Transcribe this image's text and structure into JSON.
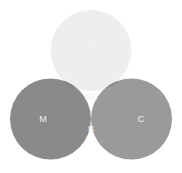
{
  "diagram": {
    "type": "venn",
    "background_color": "#ffffff",
    "canvas": {
      "width": 182,
      "height": 173
    },
    "circles": [
      {
        "id": "y",
        "label": "Y",
        "name": "Yellow",
        "cx": 91,
        "cy": 50.5,
        "r": 40.5,
        "fill": "#eeeeee",
        "label_x": 91,
        "label_y": 45,
        "label_color": "#f5f5f5",
        "label_size": 9
      },
      {
        "id": "m",
        "label": "M",
        "name": "Magenta",
        "cx": 50.5,
        "cy": 119,
        "r": 40.5,
        "fill": "#8a8a8a",
        "label_x": 43,
        "label_y": 120,
        "label_color": "#f2f2f2",
        "label_size": 9
      },
      {
        "id": "c",
        "label": "C",
        "name": "Cyan",
        "cx": 131.5,
        "cy": 119,
        "r": 40.5,
        "fill": "#9a9a9a",
        "label_x": 141,
        "label_y": 120,
        "label_color": "#f2f2f2",
        "label_size": 9
      }
    ],
    "intersections": [
      {
        "id": "r",
        "label": "R",
        "name": "Red",
        "of": [
          "Y",
          "M"
        ],
        "fill": "#717171",
        "label_x": 63,
        "label_y": 77,
        "label_color": "#f2f2f2",
        "label_size": 9
      },
      {
        "id": "g",
        "label": "G",
        "name": "Green",
        "of": [
          "Y",
          "C"
        ],
        "fill": "#787878",
        "label_x": 122,
        "label_y": 77,
        "label_color": "#f2f2f2",
        "label_size": 9
      },
      {
        "id": "b",
        "label": "B",
        "name": "Blue",
        "of": [
          "M",
          "C"
        ],
        "fill": "#383838",
        "label_x": 91,
        "label_y": 130,
        "label_color": "#f2f2f2",
        "label_size": 9
      },
      {
        "id": "bk",
        "label": "BK",
        "name": "Black",
        "of": [
          "Y",
          "M",
          "C"
        ],
        "fill": "#0c0c0c",
        "label_x": 91,
        "label_y": 98,
        "label_color": "#f2f2f2",
        "label_size": 9
      }
    ]
  }
}
